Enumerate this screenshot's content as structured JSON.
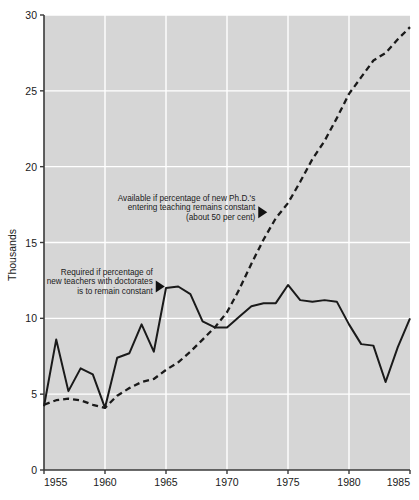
{
  "chart_data": {
    "type": "line",
    "title": "",
    "xlabel": "",
    "ylabel": "Thousands",
    "xlim": [
      1955,
      1985
    ],
    "ylim": [
      0,
      30
    ],
    "xticks": [
      1955,
      1960,
      1965,
      1970,
      1975,
      1980,
      1985
    ],
    "yticks": [
      0,
      5,
      10,
      15,
      20,
      25,
      30
    ],
    "grid": true,
    "grid_color": "#ffffff",
    "plot_background": "#d6d6d6",
    "legend": "none",
    "series": [
      {
        "name": "Required if percentage of new teachers with doctorates is to remain constant",
        "style": "solid",
        "color": "#1a1a1a",
        "x": [
          1955,
          1956,
          1957,
          1958,
          1959,
          1960,
          1961,
          1962,
          1963,
          1964,
          1965,
          1966,
          1967,
          1968,
          1969,
          1970,
          1971,
          1972,
          1973,
          1974,
          1975,
          1976,
          1977,
          1978,
          1979,
          1980,
          1981,
          1982,
          1983,
          1984,
          1985
        ],
        "y": [
          4.2,
          8.6,
          5.2,
          6.7,
          6.3,
          4.1,
          7.4,
          7.7,
          9.6,
          7.8,
          12.0,
          12.1,
          11.6,
          9.8,
          9.4,
          9.4,
          10.1,
          10.8,
          11.0,
          11.0,
          12.2,
          11.2,
          11.1,
          11.2,
          11.1,
          9.6,
          8.3,
          8.2,
          5.8,
          8.1,
          10.0
        ]
      },
      {
        "name": "Available if percentage of new Ph.D.'s entering teaching remains constant (about 50 per cent)",
        "style": "dashed",
        "color": "#1a1a1a",
        "x": [
          1955,
          1956,
          1957,
          1958,
          1959,
          1960,
          1961,
          1962,
          1963,
          1964,
          1965,
          1966,
          1967,
          1968,
          1969,
          1970,
          1971,
          1972,
          1973,
          1974,
          1975,
          1976,
          1977,
          1978,
          1979,
          1980,
          1981,
          1982,
          1983,
          1984,
          1985
        ],
        "y": [
          4.3,
          4.6,
          4.7,
          4.6,
          4.3,
          4.1,
          4.9,
          5.4,
          5.8,
          6.0,
          6.6,
          7.1,
          7.8,
          8.6,
          9.4,
          10.4,
          11.9,
          13.6,
          15.2,
          16.6,
          17.6,
          19.0,
          20.5,
          21.7,
          23.2,
          24.8,
          25.9,
          27.0,
          27.5,
          28.4,
          29.2
        ]
      }
    ],
    "annotations": [
      {
        "id": "available-annotation",
        "lines": [
          "Available if percentage of new Ph.D.'s",
          "entering teaching remains constant",
          "(about 50 per cent)"
        ],
        "marker": "triangle-right",
        "points_to_x": 1973.3,
        "points_to_y": 17.0
      },
      {
        "id": "required-annotation",
        "lines": [
          "Required if percentage of",
          "new teachers with doctorates",
          "is to remain constant"
        ],
        "marker": "triangle-right",
        "points_to_x": 1964.9,
        "points_to_y": 12.1
      }
    ]
  }
}
